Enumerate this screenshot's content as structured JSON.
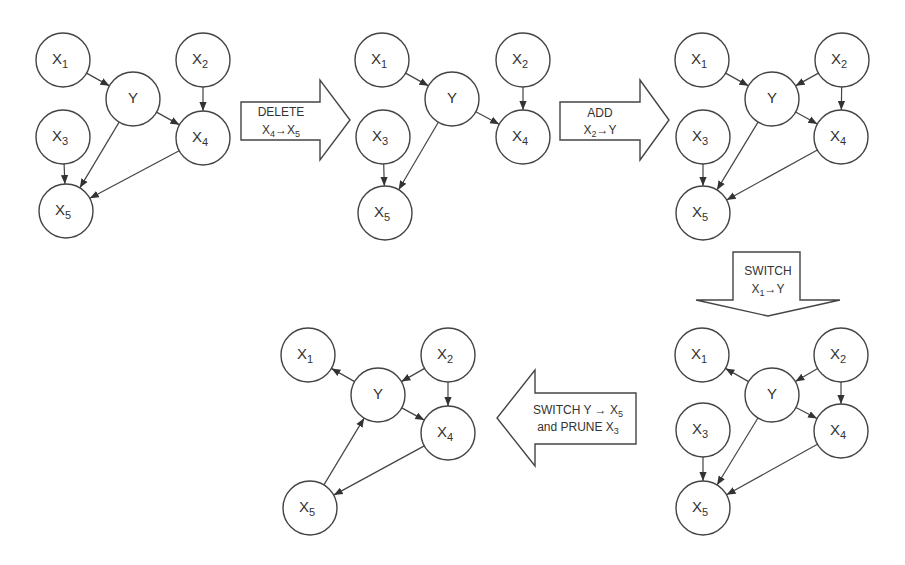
{
  "colors": {
    "stroke": "#444444",
    "background": "#ffffff",
    "text": "#333333"
  },
  "graphs": [
    {
      "id": "graph-1",
      "nodes": {
        "X1": {
          "label": "X",
          "sub": "1",
          "x": 63,
          "y": 60
        },
        "Y": {
          "label": "Y",
          "sub": "",
          "x": 133,
          "y": 99
        },
        "X2": {
          "label": "X",
          "sub": "2",
          "x": 203,
          "y": 60
        },
        "X4": {
          "label": "X",
          "sub": "4",
          "x": 203,
          "y": 138
        },
        "X3": {
          "label": "X",
          "sub": "3",
          "x": 63,
          "y": 137
        },
        "X5": {
          "label": "X",
          "sub": "5",
          "x": 66,
          "y": 211
        }
      },
      "edges": [
        [
          "X1",
          "Y"
        ],
        [
          "X2",
          "X4"
        ],
        [
          "Y",
          "X4"
        ],
        [
          "X3",
          "X5"
        ],
        [
          "Y",
          "X5"
        ],
        [
          "X4",
          "X5"
        ]
      ]
    },
    {
      "id": "graph-2",
      "nodes": {
        "X1": {
          "label": "X",
          "sub": "1",
          "x": 382,
          "y": 60
        },
        "Y": {
          "label": "Y",
          "sub": "",
          "x": 452,
          "y": 99
        },
        "X2": {
          "label": "X",
          "sub": "2",
          "x": 523,
          "y": 60
        },
        "X4": {
          "label": "X",
          "sub": "4",
          "x": 523,
          "y": 137
        },
        "X3": {
          "label": "X",
          "sub": "3",
          "x": 383,
          "y": 137
        },
        "X5": {
          "label": "X",
          "sub": "5",
          "x": 385,
          "y": 213
        }
      },
      "edges": [
        [
          "X1",
          "Y"
        ],
        [
          "X2",
          "X4"
        ],
        [
          "Y",
          "X4"
        ],
        [
          "X3",
          "X5"
        ],
        [
          "Y",
          "X5"
        ]
      ]
    },
    {
      "id": "graph-3",
      "nodes": {
        "X1": {
          "label": "X",
          "sub": "1",
          "x": 702,
          "y": 60
        },
        "Y": {
          "label": "Y",
          "sub": "",
          "x": 772,
          "y": 99
        },
        "X2": {
          "label": "X",
          "sub": "2",
          "x": 842,
          "y": 60
        },
        "X4": {
          "label": "X",
          "sub": "4",
          "x": 841,
          "y": 137
        },
        "X3": {
          "label": "X",
          "sub": "3",
          "x": 703,
          "y": 137
        },
        "X5": {
          "label": "X",
          "sub": "5",
          "x": 703,
          "y": 213
        }
      },
      "edges": [
        [
          "X1",
          "Y"
        ],
        [
          "X2",
          "Y"
        ],
        [
          "X2",
          "X4"
        ],
        [
          "Y",
          "X4"
        ],
        [
          "X3",
          "X5"
        ],
        [
          "Y",
          "X5"
        ],
        [
          "X4",
          "X5"
        ]
      ]
    },
    {
      "id": "graph-4",
      "nodes": {
        "X1": {
          "label": "X",
          "sub": "1",
          "x": 702,
          "y": 355
        },
        "Y": {
          "label": "Y",
          "sub": "",
          "x": 772,
          "y": 395
        },
        "X2": {
          "label": "X",
          "sub": "2",
          "x": 841,
          "y": 355
        },
        "X4": {
          "label": "X",
          "sub": "4",
          "x": 841,
          "y": 431
        },
        "X3": {
          "label": "X",
          "sub": "3",
          "x": 703,
          "y": 430
        },
        "X5": {
          "label": "X",
          "sub": "5",
          "x": 703,
          "y": 508
        }
      },
      "edges": [
        [
          "Y",
          "X1"
        ],
        [
          "X2",
          "Y"
        ],
        [
          "X2",
          "X4"
        ],
        [
          "Y",
          "X4"
        ],
        [
          "X3",
          "X5"
        ],
        [
          "Y",
          "X5"
        ],
        [
          "X4",
          "X5"
        ]
      ]
    },
    {
      "id": "graph-5",
      "nodes": {
        "X1": {
          "label": "X",
          "sub": "1",
          "x": 308,
          "y": 355
        },
        "Y": {
          "label": "Y",
          "sub": "",
          "x": 378,
          "y": 395
        },
        "X2": {
          "label": "X",
          "sub": "2",
          "x": 448,
          "y": 355
        },
        "X4": {
          "label": "X",
          "sub": "4",
          "x": 448,
          "y": 433
        },
        "X5": {
          "label": "X",
          "sub": "5",
          "x": 310,
          "y": 508
        }
      },
      "edges": [
        [
          "Y",
          "X1"
        ],
        [
          "X2",
          "Y"
        ],
        [
          "X2",
          "X4"
        ],
        [
          "Y",
          "X4"
        ],
        [
          "X5",
          "Y"
        ],
        [
          "X4",
          "X5"
        ]
      ]
    }
  ],
  "operations": [
    {
      "id": "op-delete",
      "direction": "right",
      "line1": "DELETE",
      "line2_from": "X",
      "line2_from_sub": "4",
      "line2_arrow": "→",
      "line2_to": "X",
      "line2_to_sub": "5"
    },
    {
      "id": "op-add",
      "direction": "right",
      "line1": "ADD",
      "line2_from": "X",
      "line2_from_sub": "2",
      "line2_arrow": "→",
      "line2_to": "Y",
      "line2_to_sub": ""
    },
    {
      "id": "op-switch",
      "direction": "down",
      "line1": "SWITCH",
      "line2_from": "X",
      "line2_from_sub": "1",
      "line2_arrow": "→",
      "line2_to": "Y",
      "line2_to_sub": ""
    },
    {
      "id": "op-switch-prune",
      "direction": "left",
      "line1": "SWITCH Y → X",
      "line1_sub": "5",
      "line2": "and PRUNE X",
      "line2_sub": "3"
    }
  ]
}
